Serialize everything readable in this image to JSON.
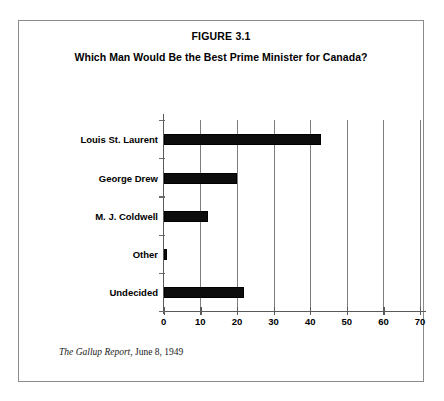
{
  "figure": {
    "number_label": "FIGURE 3.1",
    "question_title": "Which Man Would Be the Best Prime Minister for Canada?",
    "source_title": "The Gallup Report",
    "source_rest": ", June 8, 1949"
  },
  "colors": {
    "bar": "#0d0d0d",
    "axis": "#5a5a5a",
    "gridline": "#7d7d7d",
    "frame": "#8a8a8a",
    "background": "#ffffff",
    "text": "#000000"
  },
  "chart_data": {
    "type": "bar",
    "orientation": "horizontal",
    "title": "Which Man Would Be the Best Prime Minister for Canada?",
    "subtitle": "FIGURE 3.1",
    "categories": [
      "Louis St. Laurent",
      "George Drew",
      "M. J. Coldwell",
      "Other",
      "Undecided"
    ],
    "values": [
      43,
      20,
      12,
      1,
      22
    ],
    "xlabel": "",
    "ylabel": "",
    "xlim": [
      0,
      70
    ],
    "xticks": [
      0,
      10,
      20,
      30,
      40,
      50,
      60,
      70
    ],
    "xtick_labels": [
      "0",
      "10",
      "20",
      "30",
      "40",
      "50",
      "60",
      "70"
    ],
    "grid": "vertical",
    "legend": "none",
    "source": "The Gallup Report, June 8, 1949"
  }
}
